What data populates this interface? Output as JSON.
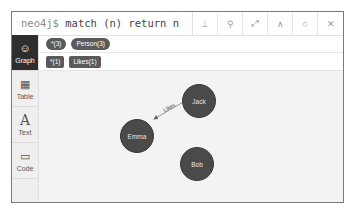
{
  "header": {
    "prompt": "neo4j$",
    "query": "match (n) return n",
    "buttons": [
      {
        "name": "download-button",
        "icon": "⊥"
      },
      {
        "name": "pin-button",
        "icon": "⚲"
      },
      {
        "name": "fullscreen-button",
        "icon": "⤢"
      },
      {
        "name": "collapse-button",
        "icon": "∧"
      },
      {
        "name": "rerun-button",
        "icon": "○"
      },
      {
        "name": "close-button",
        "icon": "✕"
      }
    ]
  },
  "sidebar": {
    "items": [
      {
        "label": "Graph",
        "icon": "☺",
        "active": true
      },
      {
        "label": "Table",
        "icon": "▦"
      },
      {
        "label": "Text",
        "icon": "A"
      },
      {
        "label": "Code",
        "icon": "▭"
      }
    ]
  },
  "labels": {
    "node_all": "*(3)",
    "node_person": "Person(3)",
    "rel_all": "*(1)",
    "rel_likes": "Likes(1)"
  },
  "graph": {
    "nodes": [
      {
        "id": "jack",
        "label": "Jack"
      },
      {
        "id": "emma",
        "label": "Emma"
      },
      {
        "id": "bob",
        "label": "Bob"
      }
    ],
    "relationships": [
      {
        "from": "Jack",
        "to": "Emma",
        "type": "Likes"
      }
    ],
    "node_color": "#4a4a4a",
    "canvas_color": "#f3f3f3"
  }
}
